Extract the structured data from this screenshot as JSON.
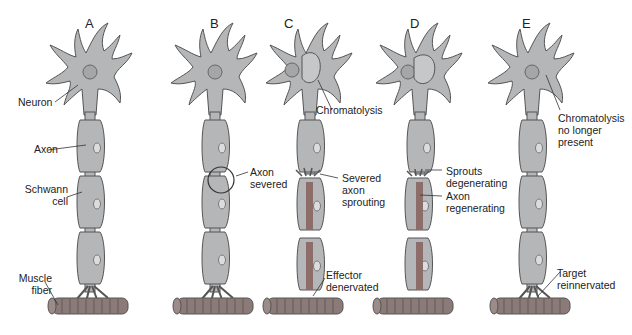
{
  "panels": [
    {
      "letter": "A",
      "labels": {
        "neuron": "Neuron",
        "axon": "Axon",
        "schwann": "Schwann\ncell",
        "muscle": "Muscle\nfiber"
      }
    },
    {
      "letter": "B",
      "labels": {
        "severed": "Axon\nsevered"
      }
    },
    {
      "letter": "C",
      "labels": {
        "chromatolysis": "Chromatolysis",
        "sprouting": "Severed\naxon\nsprouting",
        "denervated": "Effector\ndenervated"
      }
    },
    {
      "letter": "D",
      "labels": {
        "sprouts": "Sprouts\ndegenerating",
        "regenerating": "Axon\nregenerating"
      }
    },
    {
      "letter": "E",
      "labels": {
        "chromatolysis_gone": "Chromatolysis\nno longer\npresent",
        "reinnervated": "Target\nreinnervated"
      }
    }
  ],
  "colors": {
    "cell": "#b5b6b8",
    "outline": "#555555",
    "muscle": "#8a7a78",
    "axon_regen": "#8c6d6a"
  }
}
